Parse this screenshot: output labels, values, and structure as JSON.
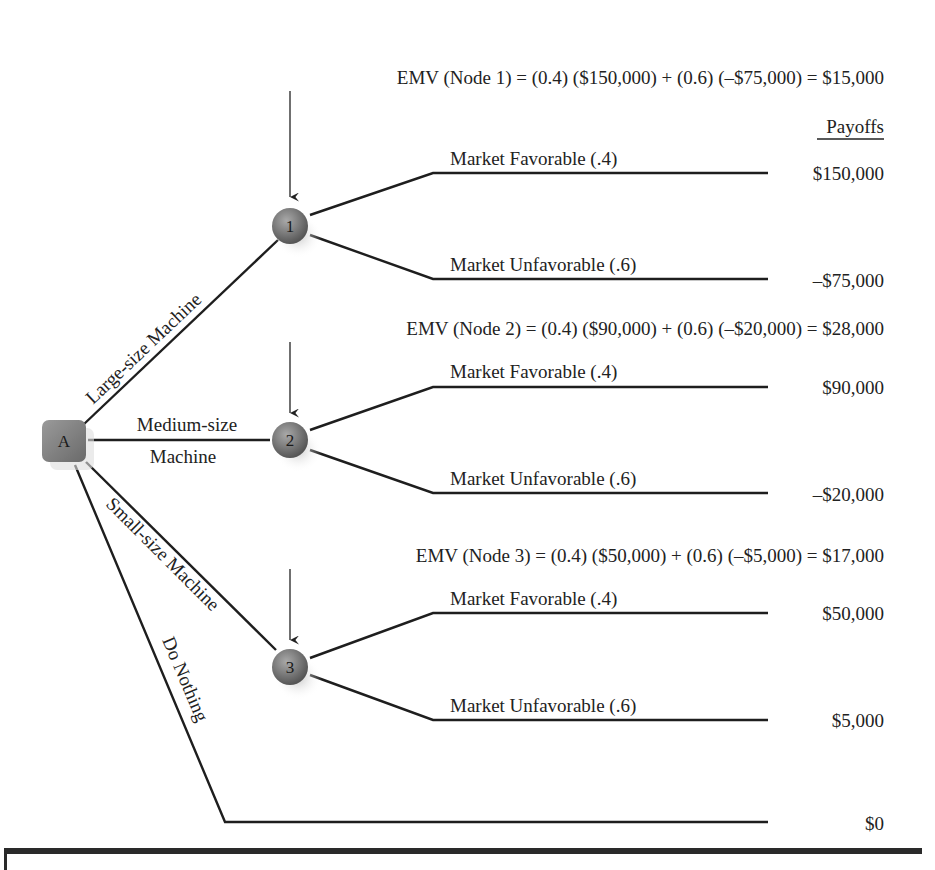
{
  "diagram": {
    "decision_node": {
      "label": "A"
    },
    "payoffs_header": "Payoffs",
    "alternatives": [
      {
        "label": "Large-size Machine",
        "node": "1",
        "emv_text": "EMV (Node 1) = (0.4) ($150,000) + (0.6) (–$75,000) = $15,000",
        "favorable_label": "Market Favorable (.4)",
        "unfavorable_label": "Market Unfavorable (.6)",
        "favorable_payoff": "$150,000",
        "unfavorable_payoff": "–$75,000"
      },
      {
        "label_line1": "Medium-size",
        "label_line2": "Machine",
        "node": "2",
        "emv_text": "EMV (Node 2) = (0.4) ($90,000) + (0.6) (–$20,000) = $28,000",
        "favorable_label": "Market Favorable (.4)",
        "unfavorable_label": "Market Unfavorable (.6)",
        "favorable_payoff": "$90,000",
        "unfavorable_payoff": "–$20,000"
      },
      {
        "label": "Small-size Machine",
        "node": "3",
        "emv_text": "EMV (Node 3) = (0.4) ($50,000) + (0.6) (–$5,000) = $17,000",
        "favorable_label": "Market Favorable (.4)",
        "unfavorable_label": "Market Unfavorable (.6)",
        "favorable_payoff": "$50,000",
        "unfavorable_payoff": "$5,000"
      },
      {
        "label": "Do Nothing",
        "payoff": "$0"
      }
    ],
    "colors": {
      "node_fill": "#7a7a7a",
      "node_highlight": "#a8a8a8",
      "line": "#1e1e1e"
    }
  }
}
